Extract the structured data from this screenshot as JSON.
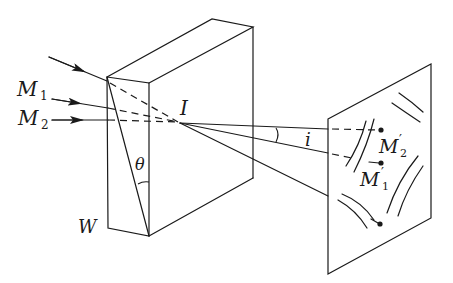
{
  "figure": {
    "stroke_color": "#1a1a1a",
    "background": "#ffffff"
  },
  "labels": {
    "m1": "M",
    "m1_sub": "1",
    "m2": "M",
    "m2_sub": "2",
    "point_i": "I",
    "angle_i": "i",
    "theta": "θ",
    "wedge": "W",
    "m2_prime": "M",
    "m2_prime_sub": "2",
    "m2_prime_mark": "′",
    "m1_prime": "M",
    "m1_prime_sub": "1",
    "m1_prime_mark": "′"
  }
}
